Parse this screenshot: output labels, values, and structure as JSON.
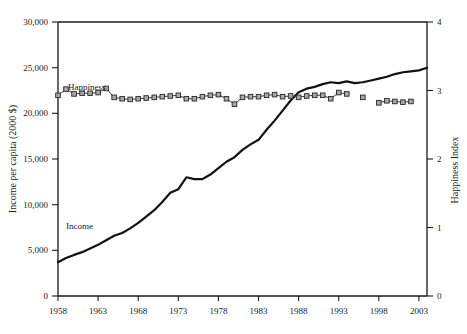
{
  "figure": {
    "background_color": "#ffffff",
    "text_color": "#1a1a1a",
    "income_color": "#111111",
    "happiness_line_color": "#3d3d3d",
    "happiness_marker_fill": "#a8a8a8",
    "happiness_marker_stroke": "#262626"
  },
  "labels": {
    "left_axis_title": "Income per capita (2000 $)",
    "right_axis_title": "Happiness Index",
    "income_series_label": "Income",
    "happiness_series_label": "Happiness",
    "y_left_ticks": [
      "0",
      "5,000",
      "10,000",
      "15,000",
      "20,000",
      "25,000",
      "30,000"
    ],
    "y_right_ticks": [
      "0",
      "1",
      "2",
      "3",
      "4"
    ],
    "x_ticks": [
      "1958",
      "1963",
      "1968",
      "1973",
      "1978",
      "1983",
      "1988",
      "1993",
      "1998",
      "2003"
    ]
  },
  "chart_data": {
    "type": "line",
    "title": "",
    "xlabel": "",
    "ylabel": "Income per capita (2000 $)",
    "y2label": "Happiness Index",
    "xlim": [
      1958,
      2004
    ],
    "ylim": [
      0,
      30000
    ],
    "y2lim": [
      0,
      4
    ],
    "y_ticks": [
      0,
      5000,
      10000,
      15000,
      20000,
      25000,
      30000
    ],
    "y2_ticks": [
      0,
      1,
      2,
      3,
      4
    ],
    "x_ticks": [
      1958,
      1963,
      1968,
      1973,
      1978,
      1983,
      1988,
      1993,
      1998,
      2003
    ],
    "grid": false,
    "legend": "inline-annotations",
    "series": [
      {
        "name": "Income",
        "axis": "left",
        "style": "solid-thick-line",
        "x": [
          1958,
          1959,
          1960,
          1961,
          1962,
          1963,
          1964,
          1965,
          1966,
          1967,
          1968,
          1969,
          1970,
          1971,
          1972,
          1973,
          1974,
          1975,
          1976,
          1977,
          1978,
          1979,
          1980,
          1981,
          1982,
          1983,
          1984,
          1985,
          1986,
          1987,
          1988,
          1989,
          1990,
          1991,
          1992,
          1993,
          1994,
          1995,
          1996,
          1997,
          1998,
          1999,
          2000,
          2001,
          2002,
          2003,
          2004
        ],
        "values": [
          3700,
          4150,
          4500,
          4800,
          5200,
          5600,
          6100,
          6600,
          6900,
          7400,
          8000,
          8700,
          9400,
          10300,
          11300,
          11700,
          13000,
          12800,
          12800,
          13300,
          14000,
          14700,
          15200,
          16000,
          16600,
          17100,
          18200,
          19200,
          20300,
          21400,
          22300,
          22700,
          22900,
          23200,
          23400,
          23300,
          23500,
          23300,
          23400,
          23600,
          23800,
          24000,
          24300,
          24500,
          24600,
          24700,
          25000
        ]
      },
      {
        "name": "Happiness",
        "axis": "right",
        "style": "thin-line-with-square-markers",
        "x": [
          1958,
          1959,
          1960,
          1961,
          1962,
          1963,
          1964,
          1965,
          1966,
          1967,
          1968,
          1969,
          1970,
          1971,
          1972,
          1973,
          1974,
          1975,
          1976,
          1977,
          1978,
          1979,
          1980,
          1981,
          1982,
          1983,
          1984,
          1985,
          1986,
          1987,
          1988,
          1989,
          1990,
          1991,
          1992,
          1993,
          1994,
          1996,
          1998,
          1999,
          2000,
          2001,
          2002
        ],
        "values": [
          2.93,
          3.02,
          2.95,
          2.96,
          2.96,
          2.97,
          3.03,
          2.9,
          2.88,
          2.87,
          2.88,
          2.89,
          2.9,
          2.91,
          2.92,
          2.93,
          2.88,
          2.88,
          2.91,
          2.93,
          2.94,
          2.88,
          2.8,
          2.9,
          2.91,
          2.91,
          2.93,
          2.94,
          2.91,
          2.92,
          2.9,
          2.92,
          2.93,
          2.93,
          2.88,
          2.97,
          2.95,
          2.9,
          2.82,
          2.85,
          2.84,
          2.83,
          2.84
        ],
        "gap_note": "series is interrupted between 1994 and 1998"
      }
    ]
  }
}
